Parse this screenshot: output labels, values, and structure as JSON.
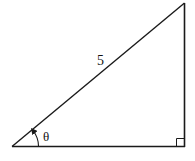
{
  "diagram": {
    "type": "right-triangle",
    "stroke_color": "#1a1a1a",
    "background": "#ffffff",
    "vertices": {
      "bottom_left": [
        12,
        146
      ],
      "bottom_right": [
        184,
        146
      ],
      "top_right": [
        184,
        3
      ]
    },
    "labels": {
      "hypotenuse": "5",
      "angle": "θ"
    },
    "right_angle_marker": true,
    "angle_arc_arrow": true
  }
}
